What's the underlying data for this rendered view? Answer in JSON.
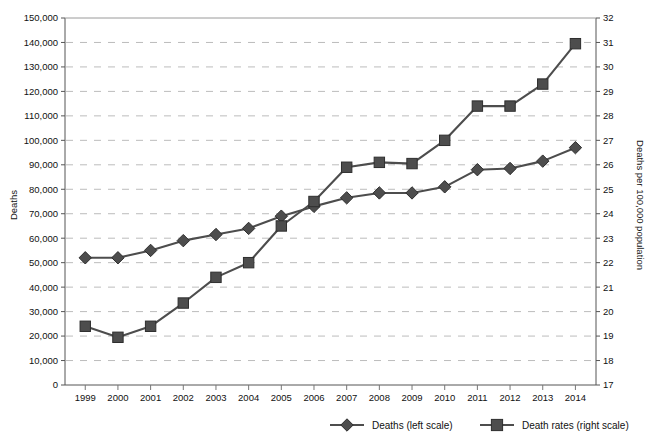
{
  "figure": {
    "partial_title": "",
    "y_left_label": "Deaths",
    "y_right_label": "Deaths per 100,000 population"
  },
  "legend": {
    "position": "bottom-right",
    "entries": [
      {
        "label": "Deaths (left scale)",
        "marker": "diamond-marker-icon",
        "color": "#4d4d4d"
      },
      {
        "label": "Death rates (right scale)",
        "marker": "square-marker-icon",
        "color": "#4d4d4d"
      }
    ]
  },
  "colors": {
    "series": "#4d4d4d",
    "axis": "#555555",
    "grid": "#bcbcbc",
    "text": "#111111",
    "background": "#ffffff"
  },
  "chart_data": {
    "type": "line",
    "title": "",
    "xlabel": "",
    "ylabel": "Deaths",
    "y2label": "Deaths per 100,000 population",
    "grid": true,
    "legend_position": "bottom-right",
    "categories": [
      "1999",
      "2000",
      "2001",
      "2002",
      "2003",
      "2004",
      "2005",
      "2006",
      "2007",
      "2008",
      "2009",
      "2010",
      "2011",
      "2012",
      "2013",
      "2014"
    ],
    "x": [
      1999,
      2000,
      2001,
      2002,
      2003,
      2004,
      2005,
      2006,
      2007,
      2008,
      2009,
      2010,
      2011,
      2012,
      2013,
      2014
    ],
    "ylim": [
      0,
      150000
    ],
    "y2lim": [
      17,
      32
    ],
    "yticks": [
      0,
      10000,
      20000,
      30000,
      40000,
      50000,
      60000,
      70000,
      80000,
      90000,
      100000,
      110000,
      120000,
      130000,
      140000,
      150000
    ],
    "yticklabels": [
      "0",
      "10,000",
      "20,000",
      "30,000",
      "40,000",
      "50,000",
      "60,000",
      "70,000",
      "80,000",
      "90,000",
      "100,000",
      "110,000",
      "120,000",
      "130,000",
      "140,000",
      "150,000"
    ],
    "y2ticks": [
      17,
      18,
      19,
      20,
      21,
      22,
      23,
      24,
      25,
      26,
      27,
      28,
      29,
      30,
      31,
      32
    ],
    "y2ticklabels": [
      "17",
      "18",
      "19",
      "20",
      "21",
      "22",
      "23",
      "24",
      "25",
      "26",
      "27",
      "28",
      "29",
      "30",
      "31",
      "32"
    ],
    "series": [
      {
        "name": "Deaths (left scale)",
        "axis": "left",
        "marker": "diamond",
        "color": "#4d4d4d",
        "values": [
          52000,
          52000,
          55000,
          59000,
          61500,
          64000,
          69000,
          73000,
          76500,
          78500,
          78500,
          81000,
          88000,
          88500,
          91500,
          97000
        ]
      },
      {
        "name": "Death rates (right scale)",
        "axis": "right",
        "marker": "square",
        "color": "#4d4d4d",
        "values": [
          19.4,
          18.95,
          19.4,
          20.35,
          21.4,
          22.0,
          23.5,
          24.5,
          25.9,
          26.1,
          26.05,
          27.0,
          28.4,
          28.4,
          29.3,
          30.95
        ]
      }
    ]
  }
}
